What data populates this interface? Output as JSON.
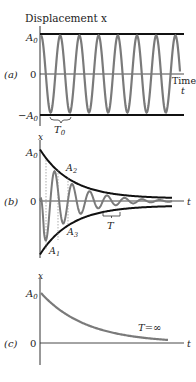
{
  "panels": [
    {
      "id": "a",
      "label": "(a)",
      "title": "Displacement x",
      "y_ticks": {
        "top": "A",
        "top_sub": "0",
        "zero": "0",
        "bottom": "−A",
        "bottom_sub": "0"
      },
      "x_label_line1": "Time",
      "x_label_line2": "t",
      "period_label": "T",
      "period_sub": "0",
      "description": "Undamped simple harmonic oscillation between constant amplitude lines ±A0"
    },
    {
      "id": "b",
      "label": "(b)",
      "y_axis_label": "x",
      "x_axis_label": "t",
      "y_ticks": {
        "top": "A",
        "top_sub": "0",
        "zero": "0"
      },
      "annotations": [
        {
          "text": "A",
          "sub": "1"
        },
        {
          "text": "A",
          "sub": "2"
        },
        {
          "text": "A",
          "sub": "3"
        }
      ],
      "period_label": "T",
      "description": "Damped oscillation with exponentially decaying envelope"
    },
    {
      "id": "c",
      "label": "(c)",
      "y_axis_label": "x",
      "x_axis_label": "t",
      "y_ticks": {
        "top": "A",
        "top_sub": "0",
        "zero": "0"
      },
      "curve_label": "T=∞",
      "description": "Overdamped (critically damped) exponential decay with infinite period"
    }
  ],
  "colors": {
    "curve": "#7a7a7a",
    "axes": "#222222",
    "envelope": "#111111"
  }
}
